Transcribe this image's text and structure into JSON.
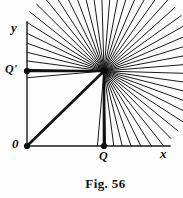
{
  "figure": {
    "caption": "Fig. 56",
    "background_color": "#fdfdfd",
    "ink_color": "#1a1a1a"
  },
  "labels": {
    "y_axis": "y",
    "x_axis": "x",
    "origin": "0",
    "q_point": "Q",
    "q_prime_point": "Q'"
  },
  "chart_data": {
    "type": "diagram",
    "title": "Fig. 56",
    "axes": {
      "x_axis": {
        "label": "x",
        "from": [
          27,
          146
        ],
        "to": [
          170,
          146
        ]
      },
      "y_axis": {
        "label": "y",
        "from": [
          27,
          146
        ],
        "to": [
          27,
          22
        ]
      }
    },
    "points": [
      {
        "name": "0",
        "label": "0",
        "coords": [
          27,
          146
        ],
        "marker": "filled-dot",
        "on": "origin"
      },
      {
        "name": "Q",
        "label": "Q",
        "coords": [
          104,
          146
        ],
        "marker": "filled-dot",
        "on": "x-axis"
      },
      {
        "name": "Qprime",
        "label": "Q'",
        "coords": [
          27,
          71
        ],
        "marker": "filled-dot",
        "on": "y-axis"
      },
      {
        "name": "center",
        "label": "",
        "coords": [
          104,
          71
        ],
        "marker": "convergence",
        "on": "interior"
      }
    ],
    "emphasized_segments": [
      {
        "name": "origin-to-center",
        "from": [
          27,
          146
        ],
        "to": [
          104,
          71
        ],
        "weight": "thick"
      },
      {
        "name": "qprime-to-center",
        "from": [
          27,
          71
        ],
        "to": [
          104,
          71
        ],
        "weight": "thick"
      },
      {
        "name": "q-to-center",
        "from": [
          104,
          146
        ],
        "to": [
          104,
          71
        ],
        "weight": "thick"
      }
    ],
    "ray_pencil": {
      "center": [
        104,
        71
      ],
      "count": 46,
      "angle_start_deg": -95,
      "angle_end_deg": 185,
      "outer_radius": 95,
      "stroke_width": 1,
      "note": "Rays emanate from the common point, clipped by the axes on the left and bottom"
    },
    "grid": false,
    "legend": false
  }
}
